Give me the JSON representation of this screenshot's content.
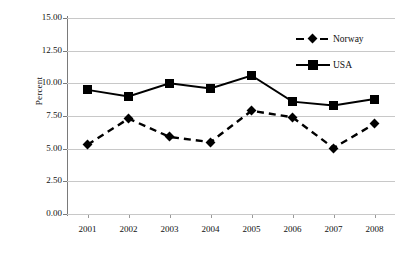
{
  "chart_data": {
    "type": "line",
    "title": "",
    "xlabel": "",
    "ylabel": "Percent",
    "categories": [
      "2001",
      "2002",
      "2003",
      "2004",
      "2005",
      "2006",
      "2007",
      "2008"
    ],
    "ylim": [
      0,
      15
    ],
    "ytick_labels": [
      "15.00",
      "12.50",
      "10.00",
      "7.50",
      "5.00",
      "2.50",
      "0.00"
    ],
    "ytick_values": [
      15,
      12.5,
      10,
      7.5,
      5,
      2.5,
      0
    ],
    "grid": true,
    "legend_position": "top-right",
    "series": [
      {
        "name": "Norway",
        "marker": "diamond",
        "linestyle": "dashed",
        "color": "#000000",
        "values": [
          5.3,
          7.3,
          5.9,
          5.5,
          7.9,
          7.4,
          5.05,
          6.9
        ]
      },
      {
        "name": "USA",
        "marker": "square",
        "linestyle": "solid",
        "color": "#000000",
        "values": [
          9.5,
          9.0,
          10.0,
          9.6,
          10.6,
          8.6,
          8.3,
          8.8
        ]
      }
    ]
  },
  "legend": {
    "entries": [
      {
        "label": "Norway"
      },
      {
        "label": "USA"
      }
    ]
  },
  "axes": {
    "y_title": "Percent"
  },
  "colors": {
    "series": "#000000",
    "gridline": "#c8c8c8",
    "axis": "#7a7a7a",
    "background": "#ffffff"
  }
}
